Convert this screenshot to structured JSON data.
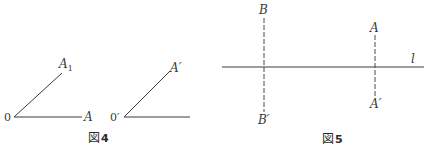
{
  "figures": [
    {
      "caption_prefix": "図",
      "caption_number": "4",
      "angles": [
        {
          "vertex_label": "0",
          "ray_end_labels": [
            "A1",
            "A"
          ],
          "ray1_label_main": "A",
          "ray1_label_sub": "1",
          "ray2_label": "A"
        },
        {
          "vertex_label": "0′",
          "ray1_label": "A′"
        }
      ]
    },
    {
      "caption_prefix": "図",
      "caption_number": "5",
      "line_label": "l",
      "points": {
        "B": "B",
        "B_prime": "B′",
        "A": "A",
        "A_prime": "A′"
      }
    }
  ],
  "colors": {
    "line": "#3a3a3a",
    "dashed": "#4a4a4a",
    "background": "#ffffff"
  }
}
